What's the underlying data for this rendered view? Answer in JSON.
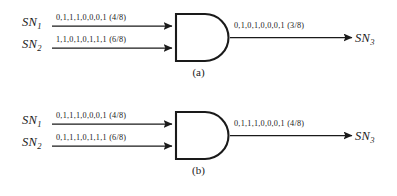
{
  "figure": {
    "background_color": "#ffffff",
    "line_color": "#1a1a1a",
    "panels": [
      {
        "id": "a",
        "caption": "(a)",
        "gate_type": "AND",
        "inputs": [
          {
            "label": "SN",
            "subscript": "1",
            "sequence": "0,1,1,1,0,0,0,1 (4/8)",
            "bits": [
              0,
              1,
              1,
              1,
              0,
              0,
              0,
              1
            ],
            "value": "4/8"
          },
          {
            "label": "SN",
            "subscript": "2",
            "sequence": "1,1,0,1,0,1,1,1 (6/8)",
            "bits": [
              1,
              1,
              0,
              1,
              0,
              1,
              1,
              1
            ],
            "value": "6/8"
          }
        ],
        "output": {
          "label": "SN",
          "subscript": "3",
          "sequence": "0,1,0,1,0,0,0,1 (3/8)",
          "bits": [
            0,
            1,
            0,
            1,
            0,
            0,
            0,
            1
          ],
          "value": "3/8"
        }
      },
      {
        "id": "b",
        "caption": "(b)",
        "gate_type": "AND",
        "inputs": [
          {
            "label": "SN",
            "subscript": "1",
            "sequence": "0,1,1,1,0,0,0,1 (4/8)",
            "bits": [
              0,
              1,
              1,
              1,
              0,
              0,
              0,
              1
            ],
            "value": "4/8"
          },
          {
            "label": "SN",
            "subscript": "2",
            "sequence": "0,1,1,1,0,1,1,1 (6/8)",
            "bits": [
              0,
              1,
              1,
              1,
              0,
              1,
              1,
              1
            ],
            "value": "6/8"
          }
        ],
        "output": {
          "label": "SN",
          "subscript": "3",
          "sequence": "0,1,1,1,0,0,0,1 (4/8)",
          "bits": [
            0,
            1,
            1,
            1,
            0,
            0,
            0,
            1
          ],
          "value": "4/8"
        }
      }
    ]
  }
}
